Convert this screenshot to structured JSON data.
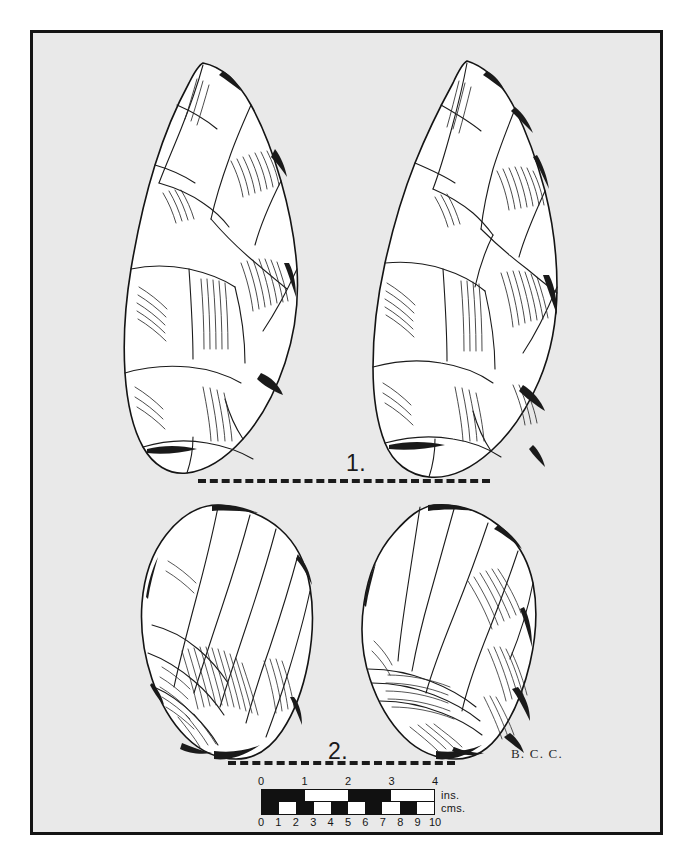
{
  "plate": {
    "background_color": "#e9e9e9",
    "border_color": "#141414",
    "page_background": "#ffffff",
    "ink_color": "#111111"
  },
  "figures": [
    {
      "number_label": "1.",
      "caption_position": "center",
      "views": [
        "dorsal",
        "ventral"
      ],
      "object_type": "flint handaxe",
      "baseline": "dashed"
    },
    {
      "number_label": "2.",
      "caption_position": "center",
      "views": [
        "dorsal",
        "ventral"
      ],
      "object_type": "flint flake",
      "baseline": "dashed"
    }
  ],
  "signature": {
    "text": "B. C. C."
  },
  "scale_bar": {
    "inches": {
      "unit_label": "ins.",
      "ticks": [
        "0",
        "1",
        "2",
        "3",
        "4"
      ],
      "max": 4,
      "segments": [
        "fill",
        "blank",
        "fill",
        "blank"
      ]
    },
    "cms": {
      "unit_label": "cms.",
      "ticks": [
        "0",
        "1",
        "2",
        "3",
        "4",
        "5",
        "6",
        "7",
        "8",
        "9",
        "10"
      ],
      "max": 10,
      "segments": [
        "fill",
        "blank",
        "fill",
        "blank",
        "fill",
        "blank",
        "fill",
        "blank",
        "fill",
        "blank"
      ]
    }
  }
}
